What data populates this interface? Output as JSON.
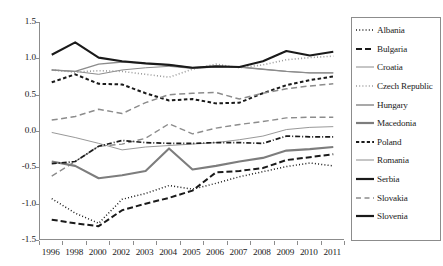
{
  "chart_data": {
    "type": "line",
    "title": "",
    "xlabel": "",
    "ylabel": "",
    "grid": false,
    "legend_position": "right",
    "categories": [
      "1996",
      "1998",
      "2000",
      "2002",
      "2003",
      "2004",
      "2005",
      "2006",
      "2007",
      "2008",
      "2009",
      "2010",
      "2011"
    ],
    "xticklabels": [
      "1996",
      "1998",
      "2000",
      "2002",
      "2003",
      "2004",
      "2005",
      "2006",
      "2007",
      "2008",
      "2009",
      "2010",
      "2011"
    ],
    "yticklabels": [
      "1.5",
      "1.0",
      "0.5",
      "0.0",
      "-0.5",
      "-1.0",
      "-1.5"
    ],
    "ytickvalues": [
      1.5,
      1.0,
      0.5,
      0.0,
      -0.5,
      -1.0,
      -1.5
    ],
    "ylim": [
      -1.5,
      1.5
    ],
    "series": [
      {
        "name": "Albania",
        "style": "dotted",
        "color": "#1a1a1a",
        "width": 1.5,
        "dash": "1,2.2",
        "values": [
          -0.93,
          -1.13,
          -1.27,
          -0.94,
          -0.86,
          -0.75,
          -0.8,
          -0.72,
          -0.63,
          -0.56,
          -0.49,
          -0.44,
          -0.48
        ]
      },
      {
        "name": "Bulgaria",
        "style": "dashed-thick",
        "color": "#1a1a1a",
        "width": 2.0,
        "dash": "6,3",
        "values": [
          -1.22,
          -1.27,
          -1.31,
          -1.09,
          -1.0,
          -0.92,
          -0.82,
          -0.57,
          -0.55,
          -0.51,
          -0.4,
          -0.36,
          -0.32
        ]
      },
      {
        "name": "Croatia",
        "style": "solid-thin",
        "color": "#8c8c8c",
        "width": 1.0,
        "dash": "",
        "values": [
          0.84,
          0.82,
          0.78,
          0.84,
          0.87,
          0.89,
          0.86,
          0.88,
          0.88,
          0.85,
          0.82,
          0.8,
          0.8
        ]
      },
      {
        "name": "Czech Republic",
        "style": "dotted",
        "color": "#9a9a9a",
        "width": 1.6,
        "dash": "1,2.2",
        "values": [
          0.84,
          0.81,
          0.83,
          0.82,
          0.78,
          0.74,
          0.85,
          0.92,
          0.87,
          0.91,
          0.98,
          1.01,
          1.03
        ]
      },
      {
        "name": "Hungary",
        "style": "solid-medium",
        "color": "#8c8c8c",
        "width": 1.4,
        "dash": "",
        "values": [
          0.84,
          0.82,
          0.92,
          0.95,
          0.93,
          0.91,
          0.87,
          0.89,
          0.88,
          0.85,
          0.82,
          0.8,
          0.8
        ]
      },
      {
        "name": "Macedonia",
        "style": "solid-thick",
        "color": "#7d7d7d",
        "width": 2.1,
        "dash": "",
        "values": [
          -0.42,
          -0.48,
          -0.65,
          -0.61,
          -0.55,
          -0.24,
          -0.53,
          -0.48,
          -0.42,
          -0.37,
          -0.27,
          -0.25,
          -0.22
        ]
      },
      {
        "name": "Poland",
        "style": "dashed-thick",
        "color": "#1a1a1a",
        "width": 2.0,
        "dash": "3.5,2.5",
        "values": [
          0.67,
          0.78,
          0.65,
          0.64,
          0.52,
          0.42,
          0.44,
          0.38,
          0.39,
          0.52,
          0.63,
          0.7,
          0.75
        ]
      },
      {
        "name": "Romania",
        "style": "solid-thin",
        "color": "#8c8c8c",
        "width": 0.9,
        "dash": "",
        "values": [
          -0.02,
          -0.09,
          -0.17,
          -0.26,
          -0.22,
          -0.2,
          -0.18,
          -0.16,
          -0.12,
          -0.07,
          0.02,
          0.05,
          0.06
        ]
      },
      {
        "name": "Serbia",
        "style": "dash-dot",
        "color": "#1a1a1a",
        "width": 1.7,
        "dash": "5,2,1,2",
        "values": [
          -0.45,
          -0.42,
          -0.21,
          -0.13,
          -0.16,
          -0.17,
          -0.17,
          -0.16,
          -0.16,
          -0.17,
          -0.07,
          -0.08,
          -0.08
        ]
      },
      {
        "name": "Slovakia",
        "style": "dashed-long",
        "color": "#8c8c8c",
        "width": 1.5,
        "dash": "6,3.5",
        "values": [
          0.15,
          0.2,
          0.3,
          0.24,
          0.39,
          0.5,
          0.52,
          0.53,
          0.44,
          0.52,
          0.58,
          0.62,
          0.65
        ]
      },
      {
        "name": "Slovenia",
        "style": "solid-thick",
        "color": "#1a1a1a",
        "width": 2.1,
        "dash": "",
        "values": [
          1.05,
          1.22,
          1.01,
          0.96,
          0.93,
          0.91,
          0.87,
          0.89,
          0.88,
          0.96,
          1.1,
          1.04,
          1.09
        ]
      },
      {
        "name": "Slovakia-low",
        "hidden": true,
        "style": "dashed-long",
        "color": "#8c8c8c",
        "width": 1.4,
        "dash": "6,3.5",
        "values": [
          -0.62,
          -0.42,
          -0.21,
          -0.18,
          -0.1,
          0.1,
          -0.04,
          0.04,
          0.09,
          0.13,
          0.18,
          0.19,
          0.19
        ]
      }
    ],
    "extra_lines": [
      {
        "name": "Romania-upper",
        "color": "#8c8c8c",
        "width": 1.4,
        "dash": "6,3.5",
        "values": [
          -0.62,
          -0.42,
          -0.21,
          -0.18,
          -0.1,
          0.1,
          -0.04,
          0.04,
          0.09,
          0.13,
          0.18,
          0.19,
          0.19
        ]
      }
    ]
  },
  "legend": {
    "items": [
      {
        "label": "Albania",
        "swatch": "dotted"
      },
      {
        "label": "Bulgaria",
        "swatch": "dashed-thick"
      },
      {
        "label": "Croatia",
        "swatch": "solid-thin"
      },
      {
        "label": "Czech Republic",
        "swatch": "dotted-gray"
      },
      {
        "label": "Hungary",
        "swatch": "solid-medium"
      },
      {
        "label": "Macedonia",
        "swatch": "solid-thick-gray"
      },
      {
        "label": "Poland",
        "swatch": "dashed-short"
      },
      {
        "label": "Romania",
        "swatch": "solid-thin"
      },
      {
        "label": "Serbia",
        "swatch": "solid-thick-dark"
      },
      {
        "label": "Slovakia",
        "swatch": "dashed-long"
      },
      {
        "label": "Slovenia",
        "swatch": "solid-thick-black"
      }
    ]
  },
  "colors": {
    "axis": "#8c8c8c",
    "dark": "#1a1a1a",
    "gray": "#8c8c8c",
    "light_gray": "#9a9a9a",
    "background": "#ffffff"
  }
}
